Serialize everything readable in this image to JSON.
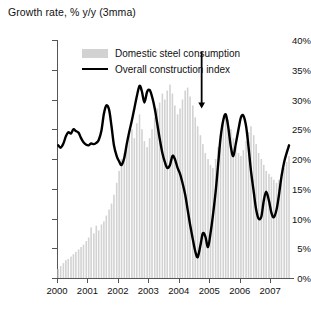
{
  "chart_title": "Growth rate, % y/y (3mma)",
  "legend": {
    "position": "top-center-inside",
    "items": [
      {
        "label": "Domestic steel consumption",
        "marker": "bar-swatch",
        "color": "#d2d2d2"
      },
      {
        "label": "Overall construction index",
        "marker": "line-swatch",
        "color": "#000000"
      }
    ]
  },
  "annotation": {
    "type": "down-arrow",
    "label": "",
    "x_value": 2004.75,
    "y_top": 38.0,
    "y_bottom": 28.5,
    "color": "#000000"
  },
  "axes": {
    "y_label": "",
    "y_tick_labels": [
      "0%",
      "5%",
      "10%",
      "15%",
      "20%",
      "25%",
      "30%",
      "35%",
      "40%"
    ],
    "x_tick_labels": [
      "2000",
      "2001",
      "2002",
      "2003",
      "2004",
      "2005",
      "2006",
      "2007"
    ]
  },
  "chart_data": {
    "type": "bar",
    "title": "Growth rate, % y/y (3mma)",
    "xlabel": "",
    "ylabel": "Growth rate, % y/y (3mma)",
    "ylim": [
      0,
      40
    ],
    "xlim": [
      2000.0,
      2007.75
    ],
    "grid": false,
    "legend_position": "top-center-inside",
    "x_tick_values": [
      2000,
      2001,
      2002,
      2003,
      2004,
      2005,
      2006,
      2007
    ],
    "x_tick_labels": [
      "2000",
      "2001",
      "2002",
      "2003",
      "2004",
      "2005",
      "2006",
      "2007"
    ],
    "y_tick_values": [
      0,
      5,
      10,
      15,
      20,
      25,
      30,
      35,
      40
    ],
    "y_tick_labels": [
      "0%",
      "5%",
      "10%",
      "15%",
      "20%",
      "25%",
      "30%",
      "35%",
      "40%"
    ],
    "x": [
      2000.04,
      2000.12,
      2000.21,
      2000.29,
      2000.37,
      2000.46,
      2000.54,
      2000.62,
      2000.71,
      2000.79,
      2000.87,
      2000.96,
      2001.04,
      2001.12,
      2001.21,
      2001.29,
      2001.37,
      2001.46,
      2001.54,
      2001.62,
      2001.71,
      2001.79,
      2001.87,
      2001.96,
      2002.04,
      2002.12,
      2002.21,
      2002.29,
      2002.37,
      2002.46,
      2002.54,
      2002.62,
      2002.71,
      2002.79,
      2002.87,
      2002.96,
      2003.04,
      2003.12,
      2003.21,
      2003.29,
      2003.37,
      2003.46,
      2003.54,
      2003.62,
      2003.71,
      2003.79,
      2003.87,
      2003.96,
      2004.04,
      2004.12,
      2004.21,
      2004.29,
      2004.37,
      2004.46,
      2004.54,
      2004.62,
      2004.71,
      2004.79,
      2004.87,
      2004.96,
      2005.04,
      2005.12,
      2005.21,
      2005.29,
      2005.37,
      2005.46,
      2005.54,
      2005.62,
      2005.71,
      2005.79,
      2005.87,
      2005.96,
      2006.04,
      2006.12,
      2006.21,
      2006.29,
      2006.37,
      2006.46,
      2006.54,
      2006.62,
      2006.71,
      2006.79,
      2006.87,
      2006.96,
      2007.04,
      2007.12,
      2007.21,
      2007.29,
      2007.37,
      2007.46,
      2007.54,
      2007.62
    ],
    "series": [
      {
        "name": "Domestic steel consumption",
        "type": "bar",
        "color": "#d2d2d2",
        "values": [
          1.5,
          2.0,
          2.5,
          3.0,
          3.2,
          3.6,
          4.0,
          4.4,
          4.8,
          5.2,
          5.6,
          6.2,
          6.8,
          8.5,
          7.5,
          8.8,
          8.0,
          9.0,
          9.5,
          10.5,
          11.5,
          12.5,
          14.0,
          16.0,
          18.0,
          20.0,
          21.0,
          22.5,
          24.0,
          25.0,
          23.5,
          26.0,
          27.5,
          25.0,
          23.0,
          22.0,
          23.5,
          25.0,
          27.0,
          28.5,
          29.5,
          31.0,
          30.0,
          31.5,
          32.5,
          31.0,
          29.0,
          27.5,
          28.5,
          30.0,
          31.5,
          32.0,
          30.5,
          29.0,
          27.0,
          25.5,
          24.0,
          22.5,
          21.0,
          20.0,
          19.0,
          18.5,
          20.0,
          22.0,
          24.0,
          26.0,
          27.5,
          26.5,
          25.0,
          23.5,
          22.0,
          21.0,
          20.5,
          21.5,
          23.0,
          24.5,
          25.5,
          24.0,
          22.5,
          21.0,
          20.0,
          19.0,
          18.0,
          17.5,
          17.0,
          16.5,
          16.0,
          16.5,
          17.5,
          18.5,
          19.5,
          20.5
        ]
      },
      {
        "name": "Overall construction index",
        "type": "line",
        "color": "#000000",
        "values": [
          22.3,
          21.9,
          22.6,
          23.8,
          24.5,
          24.3,
          25.0,
          24.7,
          24.4,
          23.5,
          22.8,
          22.4,
          22.3,
          22.6,
          22.5,
          22.7,
          23.2,
          24.8,
          27.6,
          29.0,
          28.3,
          25.5,
          22.3,
          20.5,
          19.6,
          19.0,
          20.2,
          22.5,
          24.5,
          26.5,
          28.5,
          30.5,
          32.3,
          31.3,
          29.5,
          31.3,
          31.6,
          30.5,
          28.5,
          26.0,
          23.5,
          21.0,
          19.5,
          18.5,
          19.0,
          20.5,
          20.0,
          18.5,
          17.5,
          16.0,
          14.0,
          11.5,
          9.0,
          6.5,
          4.5,
          3.5,
          5.5,
          7.5,
          7.0,
          5.2,
          7.5,
          10.5,
          14.5,
          19.0,
          23.5,
          26.5,
          27.5,
          25.5,
          22.0,
          20.5,
          22.5,
          25.0,
          27.0,
          27.3,
          25.5,
          22.0,
          18.0,
          14.5,
          11.5,
          10.0,
          10.3,
          13.0,
          14.5,
          13.0,
          11.0,
          10.2,
          11.5,
          14.0,
          17.0,
          19.5,
          21.0,
          22.3
        ]
      }
    ]
  }
}
